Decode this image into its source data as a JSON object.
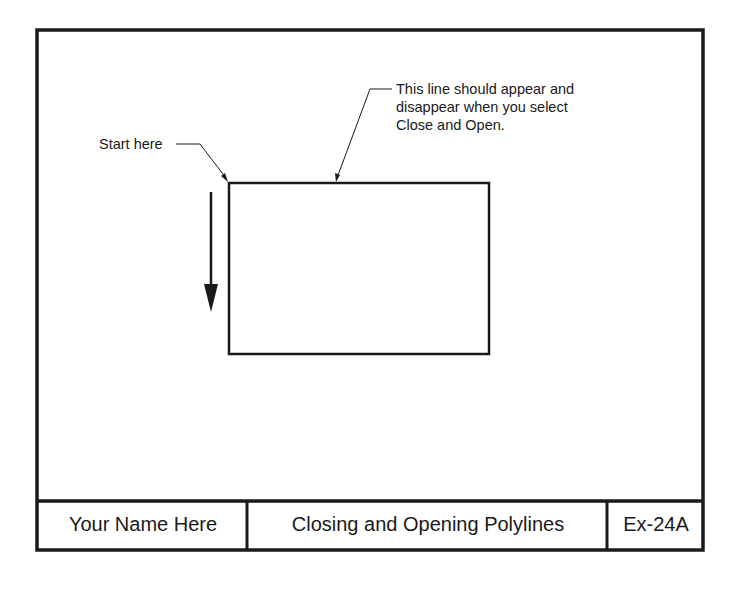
{
  "drawing": {
    "start_label": "Start here",
    "note_lines": [
      "This line should appear and",
      "disappear when you select",
      "Close and Open."
    ],
    "direction_arrow": "down-arrow"
  },
  "title_block": {
    "name": "Your Name Here",
    "title": "Closing and Opening Polylines",
    "exercise": "Ex-24A"
  },
  "colors": {
    "line": "#1a1a1a",
    "background": "#ffffff"
  }
}
